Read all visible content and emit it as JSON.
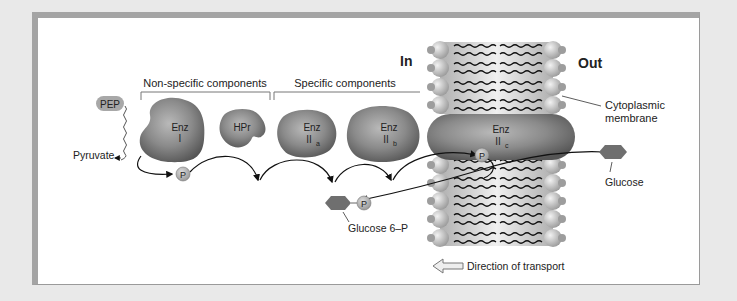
{
  "diagram": {
    "sides": {
      "in": "In",
      "out": "Out"
    },
    "brackets": {
      "non_specific": "Non-specific components",
      "specific": "Specific components"
    },
    "substrates": {
      "pep": "PEP",
      "pyruvate": "Pyruvate",
      "glucose": "Glucose",
      "glucose_6p": "Glucose 6–P",
      "phosphate": "P"
    },
    "enzymes": [
      {
        "id": "enz-i",
        "line1": "Enz",
        "line2": "I",
        "sub": ""
      },
      {
        "id": "hpr",
        "line1": "HPr",
        "line2": "",
        "sub": ""
      },
      {
        "id": "enz-iia",
        "line1": "Enz",
        "line2": "II",
        "sub": "a"
      },
      {
        "id": "enz-iib",
        "line1": "Enz",
        "line2": "II",
        "sub": "b"
      },
      {
        "id": "enz-iic",
        "line1": "Enz",
        "line2": "II",
        "sub": "c"
      }
    ],
    "membrane_label_line1": "Cytoplasmic",
    "membrane_label_line2": "membrane",
    "direction_label": "Direction of transport",
    "colors": {
      "background": "#e9e9e9",
      "panel": "#ffffff",
      "enzyme": "#7d7d7d",
      "sugar": "#6f6f6f",
      "phosphate": "#b5b5b5",
      "lipid_head": "#c8c8c8",
      "text": "#222222"
    }
  }
}
